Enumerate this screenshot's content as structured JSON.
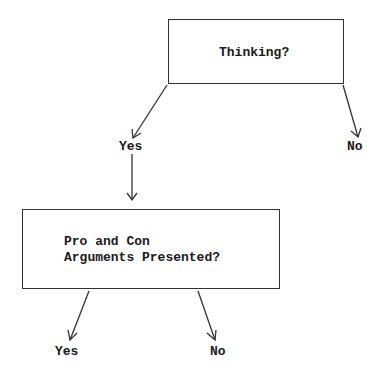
{
  "diagram": {
    "type": "decision-tree",
    "nodes": [
      {
        "id": "thinking",
        "label": "Thinking?"
      },
      {
        "id": "proandcon",
        "label_lines": [
          "Pro and Con",
          "Arguments Presented?"
        ]
      }
    ],
    "branches": {
      "thinking_yes": "Yes",
      "thinking_no": "No",
      "proandcon_yes": "Yes",
      "proandcon_no": "No"
    },
    "colors": {
      "line": "#333333",
      "text": "#1a1a1a",
      "background": "#ffffff"
    }
  }
}
